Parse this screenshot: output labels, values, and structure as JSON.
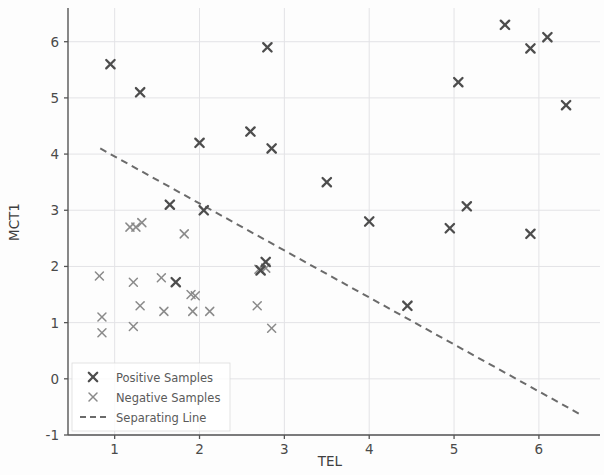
{
  "chart_data": {
    "type": "scatter",
    "title": "",
    "xlabel": "TEL",
    "ylabel": "MCT1",
    "xlim": [
      0.45,
      6.72
    ],
    "ylim": [
      -1.0,
      6.6
    ],
    "xticks": [
      1,
      2,
      3,
      4,
      5,
      6
    ],
    "yticks": [
      -1,
      0,
      1,
      2,
      3,
      4,
      5,
      6
    ],
    "grid": true,
    "legend_position": "lower left",
    "series": [
      {
        "name": "Positive Samples",
        "marker": "x-bold",
        "color": "#4d4d4d",
        "points": [
          [
            0.95,
            5.6
          ],
          [
            1.3,
            5.1
          ],
          [
            2.8,
            5.9
          ],
          [
            5.6,
            6.3
          ],
          [
            5.9,
            5.88
          ],
          [
            6.1,
            6.08
          ],
          [
            5.05,
            5.28
          ],
          [
            6.32,
            4.87
          ],
          [
            2.6,
            4.4
          ],
          [
            2.85,
            4.1
          ],
          [
            2.0,
            4.2
          ],
          [
            3.5,
            3.5
          ],
          [
            1.65,
            3.1
          ],
          [
            2.05,
            3.0
          ],
          [
            4.0,
            2.8
          ],
          [
            5.15,
            3.07
          ],
          [
            4.95,
            2.68
          ],
          [
            5.9,
            2.58
          ],
          [
            4.45,
            1.3
          ],
          [
            1.72,
            1.72
          ],
          [
            2.78,
            2.08
          ],
          [
            2.72,
            1.93
          ]
        ]
      },
      {
        "name": "Negative Samples",
        "marker": "x-thin",
        "color": "#8a8a8a",
        "points": [
          [
            0.82,
            1.83
          ],
          [
            0.85,
            1.1
          ],
          [
            0.85,
            0.82
          ],
          [
            1.22,
            0.93
          ],
          [
            1.3,
            1.3
          ],
          [
            1.22,
            1.72
          ],
          [
            1.55,
            1.8
          ],
          [
            1.58,
            1.2
          ],
          [
            1.9,
            1.5
          ],
          [
            1.92,
            1.2
          ],
          [
            2.12,
            1.2
          ],
          [
            2.68,
            1.3
          ],
          [
            2.85,
            0.9
          ],
          [
            1.32,
            2.78
          ],
          [
            1.18,
            2.7
          ],
          [
            1.25,
            2.7
          ],
          [
            1.82,
            2.58
          ],
          [
            2.78,
            1.97
          ],
          [
            2.7,
            1.95
          ],
          [
            1.95,
            1.48
          ]
        ]
      }
    ],
    "separating_line": {
      "name": "Separating Line",
      "style": "dashed",
      "color": "#6b6b6b",
      "x0": 0.83,
      "y0": 4.1,
      "x1": 6.52,
      "y1": -0.66
    }
  },
  "legend": {
    "items": [
      {
        "label": "Positive Samples",
        "kind": "marker-bold"
      },
      {
        "label": "Negative Samples",
        "kind": "marker-thin"
      },
      {
        "label": "Separating Line",
        "kind": "dashed-line"
      }
    ]
  }
}
